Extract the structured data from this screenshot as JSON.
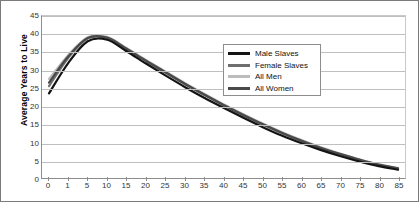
{
  "chart_data": {
    "type": "line",
    "title": "",
    "xlabel": "",
    "ylabel": "Average Years to Live",
    "ylim": [
      0,
      45
    ],
    "ytick_step": 5,
    "grid": true,
    "legend_position": "inside-top-right",
    "categories": [
      "0",
      "1",
      "5",
      "10",
      "15",
      "20",
      "25",
      "30",
      "35",
      "40",
      "45",
      "50",
      "55",
      "60",
      "65",
      "70",
      "75",
      "80",
      "85"
    ],
    "yticks": [
      "0",
      "5",
      "10",
      "15",
      "20",
      "25",
      "30",
      "35",
      "40",
      "45"
    ],
    "series": [
      {
        "name": "Male Slaves",
        "color": "#141414",
        "values": [
          23.5,
          32.0,
          38.0,
          38.4,
          35.2,
          31.8,
          28.5,
          25.3,
          22.3,
          19.5,
          16.8,
          14.2,
          11.8,
          9.7,
          7.8,
          6.1,
          4.6,
          3.3,
          2.3
        ]
      },
      {
        "name": "Female Slaves",
        "color": "#6e6e6e",
        "values": [
          25.5,
          33.4,
          38.8,
          38.9,
          35.8,
          32.5,
          29.3,
          26.1,
          23.1,
          20.2,
          17.5,
          14.9,
          12.5,
          10.3,
          8.3,
          6.6,
          5.0,
          3.6,
          2.6
        ]
      },
      {
        "name": "All Men",
        "color": "#bcbcbc",
        "values": [
          27.5,
          34.2,
          39.1,
          39.2,
          36.1,
          32.8,
          29.6,
          26.4,
          23.4,
          20.5,
          17.8,
          15.2,
          12.8,
          10.6,
          8.6,
          6.8,
          5.2,
          3.8,
          2.8
        ]
      },
      {
        "name": "All Women",
        "color": "#4a4a4a",
        "values": [
          26.5,
          33.8,
          38.9,
          39.0,
          35.9,
          32.6,
          29.4,
          26.2,
          23.2,
          20.3,
          17.6,
          15.0,
          12.6,
          10.4,
          8.4,
          6.7,
          5.1,
          3.7,
          2.7
        ]
      }
    ]
  }
}
